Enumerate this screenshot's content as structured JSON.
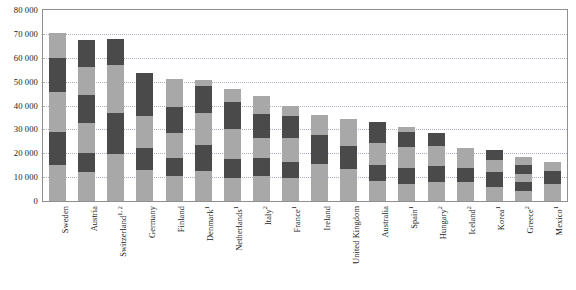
{
  "chart_data": {
    "type": "bar",
    "subtype": "stacked-bar",
    "title": "",
    "xlabel": "",
    "ylabel": "",
    "ylim": [
      0,
      80000
    ],
    "ytick_labels": [
      "0",
      "10 000",
      "20 000",
      "30 000",
      "40 000",
      "50 000",
      "60 000",
      "70 000",
      "80 000"
    ],
    "ytick_values": [
      0,
      10000,
      20000,
      30000,
      40000,
      50000,
      60000,
      70000,
      80000
    ],
    "grid": true,
    "legend": "none",
    "legend_position": "none",
    "series_colors": [
      "#a8a8a8",
      "#4a4a4a"
    ],
    "categories": [
      "Sweden",
      "Austria",
      "Switzerland",
      "Germany",
      "Finland",
      "Denmark",
      "Netherlands",
      "Italy",
      "France",
      "Ireland",
      "United Kingdom",
      "Australia",
      "Spain",
      "Hungary",
      "Iceland",
      "Korea",
      "Greece",
      "Mexico"
    ],
    "category_labels": [
      {
        "name": "Sweden",
        "note": ""
      },
      {
        "name": "Austria",
        "note": ""
      },
      {
        "name": "Switzerland",
        "note": "1, 2"
      },
      {
        "name": "Germany",
        "note": ""
      },
      {
        "name": "Finland",
        "note": ""
      },
      {
        "name": "Denmark",
        "note": "1"
      },
      {
        "name": "Netherlands",
        "note": "1"
      },
      {
        "name": "Italy",
        "note": "2"
      },
      {
        "name": "France",
        "note": "1"
      },
      {
        "name": "Ireland",
        "note": ""
      },
      {
        "name": "United Kingdom",
        "note": ""
      },
      {
        "name": "Australia",
        "note": ""
      },
      {
        "name": "Spain",
        "note": "1"
      },
      {
        "name": "Hungary",
        "note": "2"
      },
      {
        "name": "Iceland",
        "note": "2"
      },
      {
        "name": "Korea",
        "note": "1"
      },
      {
        "name": "Greece",
        "note": "2"
      },
      {
        "name": "Mexico",
        "note": "1"
      }
    ],
    "totals": [
      70500,
      67500,
      68000,
      53500,
      51000,
      50500,
      47000,
      44000,
      40000,
      36000,
      34500,
      33000,
      31000,
      28500,
      22000,
      21500,
      18500,
      16500
    ],
    "bars": [
      {
        "category": "Sweden",
        "total": 70500,
        "segments": [
          15000,
          14000,
          16500,
          14500,
          10500
        ]
      },
      {
        "category": "Austria",
        "total": 67500,
        "segments": [
          12000,
          8000,
          12500,
          12000,
          11500,
          11500
        ]
      },
      {
        "category": "Switzerland",
        "total": 68000,
        "segments": [
          19500,
          17500,
          20000,
          11000
        ]
      },
      {
        "category": "Germany",
        "total": 53500,
        "segments": [
          13000,
          9000,
          13500,
          18000
        ]
      },
      {
        "category": "Finland",
        "total": 51000,
        "segments": [
          10500,
          7500,
          10500,
          11000,
          11500
        ]
      },
      {
        "category": "Denmark",
        "total": 50500,
        "segments": [
          12500,
          11000,
          13500,
          11000,
          2500
        ]
      },
      {
        "category": "Netherlands",
        "total": 47000,
        "segments": [
          9500,
          8000,
          12500,
          11500,
          5500
        ]
      },
      {
        "category": "Italy",
        "total": 44000,
        "segments": [
          10500,
          7500,
          8500,
          10000,
          7500
        ]
      },
      {
        "category": "France",
        "total": 40000,
        "segments": [
          9500,
          7000,
          10000,
          9000,
          4500
        ]
      },
      {
        "category": "Ireland",
        "total": 36000,
        "segments": [
          15500,
          12000,
          8500
        ]
      },
      {
        "category": "United Kingdom",
        "total": 34500,
        "segments": [
          13500,
          9500,
          11500
        ]
      },
      {
        "category": "Australia",
        "total": 33000,
        "segments": [
          8500,
          6500,
          9500,
          8500
        ]
      },
      {
        "category": "Spain",
        "total": 31000,
        "segments": [
          7000,
          7000,
          8500,
          6500,
          2000
        ]
      },
      {
        "category": "Hungary",
        "total": 28500,
        "segments": [
          8000,
          6500,
          8500,
          5500
        ]
      },
      {
        "category": "Iceland",
        "total": 22000,
        "segments": [
          8000,
          6000,
          8000
        ]
      },
      {
        "category": "Korea",
        "total": 21500,
        "segments": [
          6000,
          6000,
          5000,
          4500
        ]
      },
      {
        "category": "Greece",
        "total": 18500,
        "segments": [
          4000,
          4000,
          3500,
          3500,
          3500
        ]
      },
      {
        "category": "Mexico",
        "total": 16500,
        "segments": [
          7000,
          5500,
          4000
        ]
      }
    ]
  }
}
